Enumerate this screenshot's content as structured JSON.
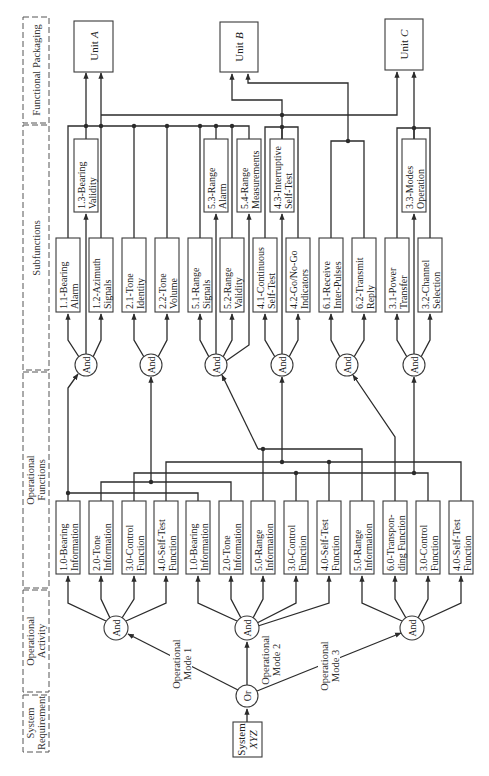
{
  "levels": [
    {
      "line1": "Functional Packaging"
    },
    {
      "line1": "Subfunctions"
    },
    {
      "line1": "Operational",
      "line2": "Functions"
    },
    {
      "line1": "Operational",
      "line2": "Activity"
    },
    {
      "line1": "System",
      "line2": "Requirement"
    }
  ],
  "units": [
    {
      "prefix": "Unit",
      "letter": "A"
    },
    {
      "prefix": "Unit",
      "letter": "B"
    },
    {
      "prefix": "Unit",
      "letter": "C"
    }
  ],
  "subfunctions": {
    "lower": [
      {
        "line1": "1.1-Bearing",
        "line2": "Alarm"
      },
      {
        "line1": "1.2-Azimuth",
        "line2": "Signals"
      },
      {
        "line1": "2.1-Tone",
        "line2": "Identity"
      },
      {
        "line1": "2.2-Tone",
        "line2": "Volume"
      },
      {
        "line1": "5.1-Range",
        "line2": "Signals"
      },
      {
        "line1": "5.2-Range",
        "line2": "Validity"
      },
      {
        "line1": "4.1-Continuous",
        "line2": "Self-Test"
      },
      {
        "line1": "4.2-Go/No-Go",
        "line2": "Indicators"
      },
      {
        "line1": "6.1-Receive",
        "line2": "Inter-Pulses"
      },
      {
        "line1": "6.2-Transmit",
        "line2": "Reply"
      },
      {
        "line1": "3.1-Power",
        "line2": "Transfer"
      },
      {
        "line1": "3.2-Channel",
        "line2": "Selection"
      }
    ],
    "upper": [
      {
        "line1": "1.3-Bearing",
        "line2": "Validity"
      },
      {
        "line1": "5.3-Range",
        "line2": "Alarm"
      },
      {
        "line1": "5.4-Range",
        "line2": "Measurements"
      },
      {
        "line1": "4.3-Interruptive",
        "line2": "Self-Test"
      },
      {
        "line1": "3.3-Modes",
        "line2": "Operation"
      }
    ]
  },
  "operational_functions": [
    {
      "line1": "1.0-Bearing",
      "line2": "Information"
    },
    {
      "line1": "2.0-Tone",
      "line2": "Information"
    },
    {
      "line1": "3.0-Control",
      "line2": "Function"
    },
    {
      "line1": "4.0-Self-Test",
      "line2": "Function"
    },
    {
      "line1": "1.0-Bearing",
      "line2": "Information"
    },
    {
      "line1": "2.0-Tone",
      "line2": "Information"
    },
    {
      "line1": "5.0-Range",
      "line2": "Information"
    },
    {
      "line1": "3.0-Control",
      "line2": "Function"
    },
    {
      "line1": "4.0-Self-Test",
      "line2": "Function"
    },
    {
      "line1": "5.0-Range",
      "line2": "Information"
    },
    {
      "line1": "6.0-Transpon-",
      "line2": "ding Function"
    },
    {
      "line1": "3.0-Control",
      "line2": "Function"
    },
    {
      "line1": "4.0-Self-Test",
      "line2": "Function"
    }
  ],
  "gates": {
    "and_label": "And",
    "or_label": "Or"
  },
  "modes": [
    {
      "line1": "Operational",
      "line2": "Mode 1"
    },
    {
      "line1": "Operational",
      "line2": "Mode 2"
    },
    {
      "line1": "Operational",
      "line2": "Mode 3"
    }
  ],
  "system": {
    "line1": "System",
    "line2": "XYZ"
  }
}
